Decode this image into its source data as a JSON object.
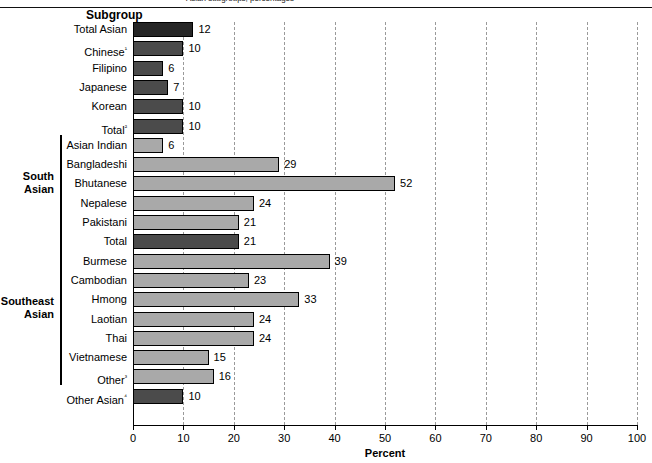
{
  "header": {
    "subgroup_title": "Subgroup",
    "top_cropped_text": "Asian subgroups, percentages"
  },
  "groups": [
    {
      "label_line1": "South",
      "label_line2": "Asian",
      "start_index": 6,
      "end_index": 10
    },
    {
      "label_line1": "Southeast",
      "label_line2": "Asian",
      "start_index": 11,
      "end_index": 18
    }
  ],
  "chart_data": {
    "type": "bar",
    "orientation": "horizontal",
    "title": "",
    "xlabel": "Percent",
    "ylabel": "Subgroup",
    "xlim": [
      0,
      100
    ],
    "xticks": [
      0,
      10,
      20,
      30,
      40,
      50,
      60,
      70,
      80,
      90,
      100
    ],
    "grid": "vertical dashed gridlines every 10 percent",
    "legend": "none",
    "categories": [
      "Total Asian",
      "Chinese¹",
      "Filipino",
      "Japanese",
      "Korean",
      "Total²",
      "Asian Indian",
      "Bangladeshi",
      "Bhutanese",
      "Nepalese",
      "Pakistani",
      "Total",
      "Burmese",
      "Cambodian",
      "Hmong",
      "Laotian",
      "Thai",
      "Vietnamese",
      "Other³",
      "Other Asian⁴"
    ],
    "values": [
      12,
      10,
      6,
      7,
      10,
      10,
      6,
      29,
      52,
      24,
      21,
      21,
      39,
      23,
      33,
      24,
      24,
      15,
      16,
      10
    ],
    "value_labels": [
      "12",
      "10",
      "6",
      "7",
      "10",
      "10",
      "6",
      "29",
      "52",
      "24",
      "21",
      "21",
      "39",
      "23",
      "33",
      "24",
      "24",
      "15",
      "16",
      "10"
    ],
    "bar_shades": [
      "dark",
      "mid",
      "mid",
      "mid",
      "mid",
      "mid",
      "light",
      "light",
      "light",
      "light",
      "light",
      "mid",
      "light",
      "light",
      "light",
      "light",
      "light",
      "light",
      "light",
      "mid"
    ]
  },
  "colors": {
    "bar_dark": "#262626",
    "bar_mid": "#4b4b4b",
    "bar_light": "#a9a9a9",
    "gridline": "#9a9a9a",
    "axis": "#000000",
    "background": "#ffffff"
  }
}
